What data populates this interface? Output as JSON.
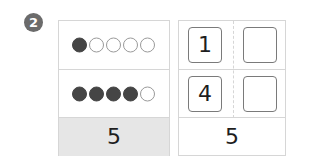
{
  "problem": {
    "number": "2"
  },
  "dot_panel": {
    "rows": [
      {
        "filled": 1,
        "empty": 4
      },
      {
        "filled": 4,
        "empty": 1
      }
    ],
    "total": "5"
  },
  "number_panel": {
    "rows": [
      [
        "1",
        ""
      ],
      [
        "4",
        ""
      ]
    ],
    "total": "5"
  },
  "colors": {
    "badge": "#6b6b6b",
    "filled_dot": "#454545",
    "total_row_bg": "#e6e6e6",
    "border": "#d6d6d6"
  }
}
